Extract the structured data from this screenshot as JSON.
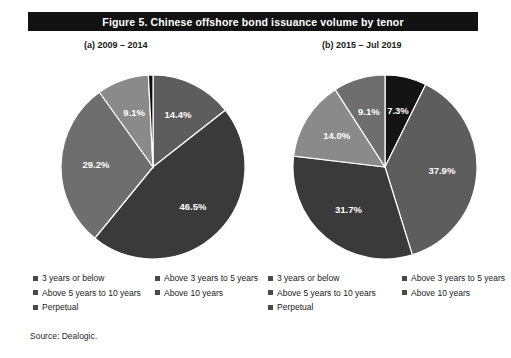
{
  "figure": {
    "title": "Figure 5.  Chinese offshore bond issuance volume by tenor",
    "source": "Source: Dealogic.",
    "title_bar_color": "#121212",
    "background_color": "#ffffff"
  },
  "panels": [
    {
      "id": "a",
      "subtitle": "(a) 2009 – 2014"
    },
    {
      "id": "b",
      "subtitle": "(b) 2015 – Jul 2019"
    }
  ],
  "legend": {
    "items": [
      {
        "label": "3 years or below",
        "color": "#4a4a4a"
      },
      {
        "label": "Above 3 years to 5 years",
        "color": "#4a4a4a"
      },
      {
        "label": "Above 5 years to 10 years",
        "color": "#4a4a4a"
      },
      {
        "label": "Above 10 years",
        "color": "#4a4a4a"
      },
      {
        "label": "Perpetual",
        "color": "#4a4a4a"
      }
    ]
  },
  "chart_data": [
    {
      "type": "pie",
      "id": "pie-a",
      "title": "(a) 2009 – 2014",
      "categories": [
        "3 years or below",
        "Above 3 years to 5 years",
        "Above 5 years to 10 years",
        "Above 10 years",
        "Perpetual"
      ],
      "values": [
        14.4,
        46.5,
        29.2,
        9.1,
        0.8
      ],
      "labels": [
        "14.4%",
        "46.5%",
        "29.2%",
        "9.1%",
        "0.8%"
      ],
      "colors": [
        "#5d5d5d",
        "#3a3a3a",
        "#6e6e6e",
        "#8a8a8a",
        "#0d0d0d"
      ],
      "label_positions": [
        "inside",
        "inside",
        "inside",
        "inside",
        "outside"
      ],
      "start_angle_deg": 0,
      "direction": "clockwise",
      "units": "percent"
    },
    {
      "type": "pie",
      "id": "pie-b",
      "title": "(b) 2015 – Jul 2019",
      "categories": [
        "3 years or below",
        "Above 3 years to 5 years",
        "Above 5 years to 10 years",
        "Above 10 years",
        "Perpetual"
      ],
      "values": [
        7.3,
        37.9,
        31.7,
        14.0,
        9.1
      ],
      "labels": [
        "7.3%",
        "37.9%",
        "31.7%",
        "14.0%",
        "9.1%"
      ],
      "colors": [
        "#141414",
        "#5d5d5d",
        "#3a3a3a",
        "#8a8a8a",
        "#6e6e6e"
      ],
      "label_positions": [
        "inside",
        "inside",
        "inside",
        "inside",
        "inside"
      ],
      "start_angle_deg": 0,
      "direction": "clockwise",
      "units": "percent"
    }
  ]
}
